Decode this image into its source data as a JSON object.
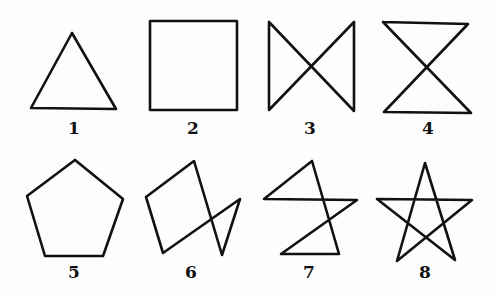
{
  "figures": [
    {
      "id": 1,
      "label": "1",
      "name": "triangle",
      "points": "72,33 31,108 116,109 72,33",
      "label_pos": [
        74,
        134
      ]
    },
    {
      "id": 2,
      "label": "2",
      "name": "square",
      "points": "150,21 237,21 237,110 150,110 150,21",
      "label_pos": [
        193,
        134
      ]
    },
    {
      "id": 3,
      "label": "3",
      "name": "bowtie",
      "points": "269,22 269,110 354,22 354,111 269,22",
      "label_pos": [
        310,
        134
      ]
    },
    {
      "id": 4,
      "label": "4",
      "name": "hourglass",
      "points": "383,22 468,24 384,112 471,113 383,22",
      "label_pos": [
        428,
        134
      ]
    },
    {
      "id": 5,
      "label": "5",
      "name": "pentagon",
      "points": "75,160 27,196 45,256 103,256 123,199 75,160",
      "label_pos": [
        74,
        278
      ]
    },
    {
      "id": 6,
      "label": "6",
      "name": "crossed-quadrilateral-with-triangle",
      "points": "146,197 194,161 222,255 240,199 163,253 146,197",
      "label_pos": [
        191,
        278
      ]
    },
    {
      "id": 7,
      "label": "7",
      "name": "zigzag-figure",
      "points": "312,161 264,199 357,200 281,254 339,254 312,161",
      "label_pos": [
        309,
        278
      ]
    },
    {
      "id": 8,
      "label": "8",
      "name": "pentagram-star",
      "points": "425,163 397,261 472,200 377,199 455,260 425,163",
      "label_pos": [
        425,
        278
      ]
    }
  ]
}
